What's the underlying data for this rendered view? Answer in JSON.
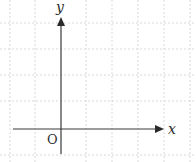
{
  "diagram": {
    "type": "cartesian-axes",
    "labels": {
      "x_axis": "x",
      "y_axis": "y",
      "origin": "O"
    },
    "grid": {
      "style": "dashed",
      "color": "#d9d9d9",
      "vertical_lines_px": [
        10,
        35,
        86,
        112,
        138,
        164,
        190
      ],
      "horizontal_lines_px": [
        23,
        49,
        75,
        101,
        155
      ]
    },
    "axes": {
      "color": "#3a3a3a",
      "origin_px": [
        61,
        129
      ],
      "x_axis_range_px": [
        13,
        163
      ],
      "y_axis_range_px": [
        18,
        154
      ]
    }
  }
}
